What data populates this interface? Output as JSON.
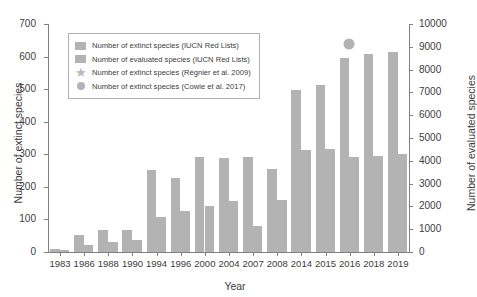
{
  "chart_data": {
    "type": "bar",
    "title": "",
    "xlabel": "Year",
    "ylabel": "Number of extinct species",
    "ylabel_right": "Number of evaluated species",
    "categories": [
      "1983",
      "1986",
      "1988",
      "1990",
      "1994",
      "1996",
      "2000",
      "2004",
      "2007",
      "2008",
      "2014",
      "2015",
      "2016",
      "2018",
      "2019"
    ],
    "ylim": [
      0,
      700
    ],
    "ylim_right": [
      0,
      10000
    ],
    "yticks": [
      0,
      100,
      200,
      300,
      400,
      500,
      600,
      700
    ],
    "yticks_right": [
      0,
      1000,
      2000,
      3000,
      4000,
      5000,
      6000,
      7000,
      8000,
      9000,
      10000
    ],
    "grid": false,
    "legend_position": "upper left",
    "series": [
      {
        "name": "Number of extinct species (IUCN Red Lists)",
        "axis": "left",
        "color": "#b3b3b3",
        "values": [
          8,
          52,
          68,
          68,
          253,
          228,
          292,
          290,
          293,
          255,
          498,
          512,
          597,
          608,
          614
        ]
      },
      {
        "name": "Number of evaluated species (IUCN Red Lists)",
        "axis": "right",
        "color": "#b3b3b3",
        "values": [
          110,
          320,
          420,
          530,
          1520,
          1790,
          2040,
          2250,
          1150,
          2270,
          4480,
          4510,
          4170,
          4190,
          4280
        ]
      }
    ],
    "markers": [
      {
        "name": "Number of extinct species (Régnier et al. 2009)",
        "symbol": "star",
        "color": "#b9b9b9",
        "category": "2007",
        "value": 533
      },
      {
        "name": "Number of extinct species (Cowie et al. 2017)",
        "symbol": "circle",
        "color": "#b3b3b3",
        "category": "2016",
        "value": 638
      }
    ],
    "legend": [
      {
        "label": "Number of extinct species (IUCN Red Lists)",
        "marker": "square",
        "color": "#b3b3b3"
      },
      {
        "label": "Number of evaluated species (IUCN Red Lists)",
        "marker": "square",
        "color": "#b3b3b3"
      },
      {
        "label": "Number of extinct species (Régnier et al. 2009)",
        "marker": "star",
        "color": "#b9b9b9"
      },
      {
        "label": "Number of extinct species (Cowie et al. 2017)",
        "marker": "circle",
        "color": "#b3b3b3"
      }
    ]
  }
}
